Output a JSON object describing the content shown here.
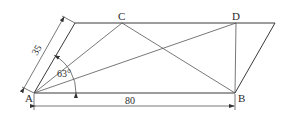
{
  "diagram": {
    "type": "parallelogram-geometry",
    "points": {
      "A": {
        "label": "A"
      },
      "B": {
        "label": "B"
      },
      "C": {
        "label": "C"
      },
      "D": {
        "label": "D"
      }
    },
    "dimensions": {
      "side_length": "35",
      "base_length": "80",
      "angle": "63°"
    },
    "colors": {
      "line": "#3a3a3a",
      "text": "#2a2a2a",
      "background": "#ffffff"
    }
  }
}
